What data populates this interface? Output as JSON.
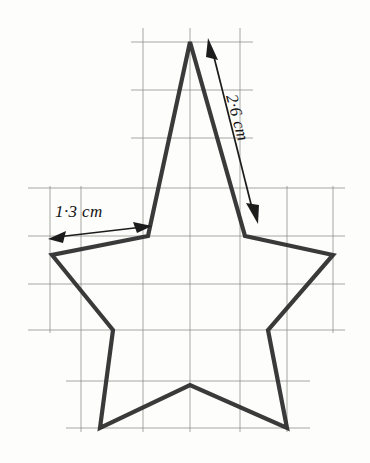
{
  "figure": {
    "background_color": "#fdfdfc",
    "ink_color": "#2b2b2b",
    "grid_color": "#8c8c88"
  },
  "annotations": {
    "horizontal_dimension": {
      "label": "1·3 cm",
      "name": "inner-segment-length",
      "value": 1.3,
      "unit": "cm",
      "arrow": "double-headed",
      "orientation": "horizontal",
      "from": [
        52,
        237
      ],
      "to": [
        148,
        226
      ]
    },
    "diagonal_dimension": {
      "label": "2·6 cm",
      "name": "star-edge-length",
      "value": 2.6,
      "unit": "cm",
      "arrow": "double-headed",
      "orientation": "diagonal",
      "from": [
        207,
        42
      ],
      "to": [
        257,
        219
      ]
    }
  },
  "chart_data": {
    "type": "scatter",
    "xlabel": "",
    "ylabel": "",
    "grid": true,
    "legend": "none",
    "xlim": [
      0,
      370
    ],
    "ylim": [
      463,
      0
    ],
    "grid_lines": {
      "vertical_x": [
        50,
        81,
        143,
        190,
        240,
        287,
        333
      ],
      "horizontal_y": [
        42,
        90,
        138,
        188,
        236,
        284,
        330,
        381,
        428
      ]
    },
    "star_points": [
      {
        "name": "apex-top",
        "x": 190,
        "y": 42
      },
      {
        "name": "inner-upper-right",
        "x": 245,
        "y": 236
      },
      {
        "name": "point-right",
        "x": 333,
        "y": 255
      },
      {
        "name": "inner-lower-right",
        "x": 268,
        "y": 330
      },
      {
        "name": "point-bottom-right",
        "x": 287,
        "y": 428
      },
      {
        "name": "inner-bottom",
        "x": 190,
        "y": 385
      },
      {
        "name": "point-bottom-left",
        "x": 100,
        "y": 428
      },
      {
        "name": "inner-lower-left",
        "x": 113,
        "y": 330
      },
      {
        "name": "point-left",
        "x": 52,
        "y": 255
      },
      {
        "name": "inner-upper-left",
        "x": 148,
        "y": 236
      }
    ]
  }
}
